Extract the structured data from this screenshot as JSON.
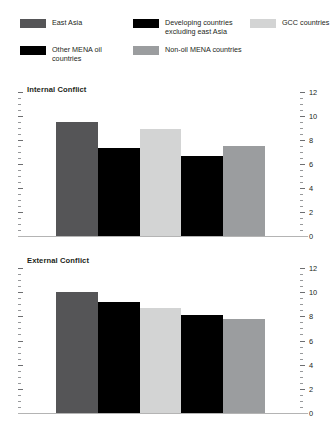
{
  "legend": {
    "items": [
      {
        "label": "East Asia",
        "color": "#555557",
        "row": 0,
        "col": 0
      },
      {
        "label": "Developing countries excluding east Asia",
        "color": "#000000",
        "row": 0,
        "col": 1
      },
      {
        "label": "GCC countries",
        "color": "#d3d4d4",
        "row": 0,
        "col": 2
      },
      {
        "label": "Other MENA oil countries",
        "color": "#000000",
        "row": 1,
        "col": 0
      },
      {
        "label": "Non-oil MENA countries",
        "color": "#9b9d9f",
        "row": 1,
        "col": 1
      }
    ]
  },
  "axis": {
    "tick_labels": [
      "12",
      "10",
      "8",
      "6",
      "4",
      "2",
      "0"
    ],
    "ticks": [
      12,
      11.5,
      11,
      10.5,
      10,
      9.5,
      9,
      8.5,
      8,
      7.5,
      7,
      6.5,
      6,
      5.5,
      5,
      4.5,
      4,
      3.5,
      3,
      2.5,
      2,
      1.5,
      1,
      0.5,
      0
    ]
  },
  "chart_data": [
    {
      "type": "bar",
      "title": "Internal Conflict",
      "xlabel": "",
      "ylabel": "",
      "ylim": [
        0,
        12
      ],
      "ytick_step": 2,
      "minor_tick_step": 0.5,
      "grid": false,
      "legend_position": "top",
      "categories": [
        "East Asia",
        "Developing countries excluding east Asia",
        "GCC countries",
        "Other MENA oil countries",
        "Non-oil MENA countries"
      ],
      "values": [
        9.5,
        7.3,
        8.9,
        6.7,
        7.5
      ],
      "colors": [
        "#555557",
        "#000000",
        "#d3d4d4",
        "#000000",
        "#9b9d9f"
      ]
    },
    {
      "type": "bar",
      "title": "External Conflict",
      "xlabel": "",
      "ylabel": "",
      "ylim": [
        0,
        12
      ],
      "ytick_step": 2,
      "minor_tick_step": 0.5,
      "grid": false,
      "legend_position": "top",
      "categories": [
        "East Asia",
        "Developing countries excluding east Asia",
        "GCC countries",
        "Other MENA oil countries",
        "Non-oil MENA countries"
      ],
      "values": [
        10.0,
        9.2,
        8.7,
        8.1,
        7.8
      ],
      "colors": [
        "#555557",
        "#000000",
        "#d3d4d4",
        "#000000",
        "#9b9d9f"
      ]
    }
  ]
}
